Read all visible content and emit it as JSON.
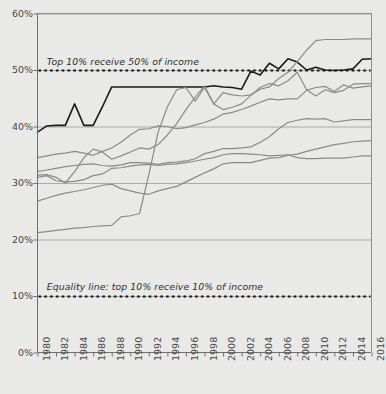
{
  "chart_data": {
    "type": "line",
    "title": "",
    "xlabel": "",
    "ylabel": "",
    "xlim": [
      1980,
      2016
    ],
    "ylim": [
      0,
      60
    ],
    "ytick_labels": [
      "0%",
      "10%",
      "20%",
      "30%",
      "40%",
      "50%",
      "60%"
    ],
    "ytick_values": [
      0,
      10,
      20,
      30,
      40,
      50,
      60
    ],
    "xtick_labels": [
      "1980",
      "1982",
      "1984",
      "1986",
      "1988",
      "1990",
      "1992",
      "1994",
      "1996",
      "1998",
      "2000",
      "2002",
      "2004",
      "2006",
      "2008",
      "2010",
      "2012",
      "2014",
      "2016"
    ],
    "xtick_values": [
      1980,
      1982,
      1984,
      1986,
      1988,
      1990,
      1992,
      1994,
      1996,
      1998,
      2000,
      2002,
      2004,
      2006,
      2008,
      2010,
      2012,
      2014,
      2016
    ],
    "grid": "horizontal-only",
    "legend": "none",
    "annotations": [
      {
        "text": "Top 10% receive 50% of income",
        "x": 1981.0,
        "y": 51.5
      },
      {
        "text": "Equality line: top 10% receive 10% of income",
        "x": 1981.0,
        "y": 11.6
      }
    ],
    "reference_lines": [
      {
        "name": "top-50-line",
        "y": 50,
        "style": "dotted",
        "color": "#111111"
      },
      {
        "name": "equality-line",
        "y": 10,
        "style": "dotted",
        "color": "#111111"
      }
    ],
    "x": [
      1980,
      1981,
      1982,
      1983,
      1984,
      1985,
      1986,
      1987,
      1988,
      1989,
      1990,
      1991,
      1992,
      1993,
      1994,
      1995,
      1996,
      1997,
      1998,
      1999,
      2000,
      2001,
      2002,
      2003,
      2004,
      2005,
      2006,
      2007,
      2008,
      2009,
      2010,
      2011,
      2012,
      2013,
      2014,
      2015,
      2016
    ],
    "series": [
      {
        "name": "series-a-dark",
        "color": "#1a1a1a",
        "width": 1.6,
        "values": [
          39.0,
          40.1,
          40.2,
          40.2,
          44.0,
          40.2,
          40.2,
          43.5,
          47.0,
          47.0,
          47.0,
          47.0,
          47.0,
          47.0,
          47.0,
          47.0,
          47.0,
          47.0,
          47.0,
          47.2,
          47.0,
          46.9,
          46.6,
          49.8,
          49.1,
          51.2,
          50.2,
          52.0,
          51.4,
          50.0,
          50.5,
          50.0,
          49.9,
          50.0,
          50.2,
          51.9,
          52.0
        ]
      },
      {
        "name": "series-b-grey-top",
        "color": "#8a8a8a",
        "width": 1.2,
        "values": [
          21.2,
          21.4,
          21.6,
          21.8,
          22.0,
          22.1,
          22.3,
          22.4,
          22.5,
          24.0,
          24.2,
          24.6,
          31.5,
          39.0,
          43.5,
          46.5,
          46.9,
          44.5,
          46.9,
          44.0,
          46.0,
          45.6,
          45.4,
          45.6,
          46.6,
          47.0,
          48.5,
          49.6,
          51.5,
          53.5,
          55.2,
          55.4,
          55.4,
          55.4,
          55.5,
          55.5,
          55.5
        ]
      },
      {
        "name": "series-c-grey-spike",
        "color": "#8a8a8a",
        "width": 1.2,
        "values": [
          31.4,
          31.5,
          31.0,
          30.0,
          32.0,
          34.5,
          36.0,
          35.5,
          34.2,
          34.8,
          35.5,
          36.2,
          36.0,
          36.8,
          38.5,
          40.5,
          43.0,
          45.2,
          47.2,
          44.0,
          43.0,
          43.4,
          44.0,
          45.5,
          46.9,
          47.6,
          47.2,
          48.1,
          49.6,
          46.5,
          45.4,
          46.5,
          46.0,
          46.4,
          47.5,
          47.6,
          47.6
        ]
      },
      {
        "name": "series-d-grey-mid-high",
        "color": "#8a8a8a",
        "width": 1.2,
        "values": [
          34.5,
          34.8,
          35.1,
          35.3,
          35.6,
          35.3,
          34.9,
          35.6,
          36.2,
          37.2,
          38.5,
          39.5,
          39.6,
          40.1,
          40.0,
          39.6,
          39.8,
          40.3,
          40.7,
          41.3,
          42.2,
          42.5,
          43.0,
          43.6,
          44.3,
          44.9,
          44.7,
          44.9,
          44.9,
          46.4,
          46.9,
          47.1,
          46.2,
          47.4,
          46.8,
          47.0,
          47.2
        ]
      },
      {
        "name": "series-e-grey-mid",
        "color": "#8a8a8a",
        "width": 1.2,
        "values": [
          32.0,
          32.3,
          32.6,
          32.9,
          33.1,
          33.3,
          33.4,
          33.1,
          33.0,
          33.2,
          33.6,
          33.6,
          33.5,
          33.3,
          33.6,
          33.7,
          33.9,
          34.3,
          35.2,
          35.6,
          36.1,
          36.1,
          36.2,
          36.4,
          37.2,
          38.2,
          39.6,
          40.7,
          41.1,
          41.4,
          41.3,
          41.4,
          40.8,
          41.0,
          41.2,
          41.2,
          41.2
        ]
      },
      {
        "name": "series-f-grey-lower",
        "color": "#8a8a8a",
        "width": 1.2,
        "values": [
          31.0,
          31.3,
          30.4,
          30.2,
          30.3,
          30.6,
          31.3,
          31.6,
          32.6,
          32.7,
          33.0,
          33.2,
          33.3,
          33.1,
          33.3,
          33.4,
          33.6,
          33.9,
          34.2,
          34.5,
          35.0,
          35.2,
          35.2,
          35.1,
          35.0,
          34.8,
          34.9,
          35.0,
          34.5,
          34.3,
          34.3,
          34.4,
          34.4,
          34.4,
          34.6,
          34.8,
          34.8
        ]
      },
      {
        "name": "series-g-grey-bottom",
        "color": "#8a8a8a",
        "width": 1.2,
        "values": [
          26.8,
          27.3,
          27.8,
          28.2,
          28.5,
          28.8,
          29.2,
          29.6,
          29.8,
          29.0,
          28.6,
          28.2,
          28.0,
          28.6,
          29.0,
          29.4,
          30.2,
          31.0,
          31.8,
          32.5,
          33.4,
          33.6,
          33.6,
          33.6,
          34.0,
          34.4,
          34.5,
          34.9,
          35.1,
          35.6,
          36.0,
          36.4,
          36.8,
          37.0,
          37.3,
          37.4,
          37.5
        ]
      }
    ]
  },
  "axes": {
    "y_label_suffix": "%",
    "x_first": "1980",
    "x_last": "2016"
  }
}
